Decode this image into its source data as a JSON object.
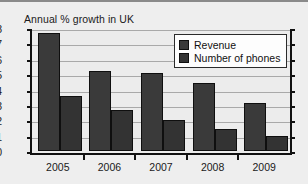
{
  "chart_data": {
    "type": "bar",
    "title": "Annual % growth in UK",
    "xlabel": "",
    "ylabel": "",
    "categories": [
      "2005",
      "2006",
      "2007",
      "2008",
      "2009"
    ],
    "series": [
      {
        "name": "Revenue",
        "values": [
          7.7,
          5.2,
          5.1,
          4.4,
          3.1
        ],
        "color": "#3a3a3a"
      },
      {
        "name": "Number of phones",
        "values": [
          3.6,
          2.7,
          2.0,
          1.4,
          1.0
        ],
        "color": "#333333"
      }
    ],
    "ylim": [
      0,
      8
    ],
    "yticks": [
      "0",
      "1",
      "2",
      "3",
      "4",
      "5",
      "6",
      "7",
      "8"
    ],
    "grid": true,
    "legend_position": "top-right"
  },
  "legend": {
    "items": [
      {
        "label": "Revenue"
      },
      {
        "label": "Number of phones"
      }
    ]
  }
}
